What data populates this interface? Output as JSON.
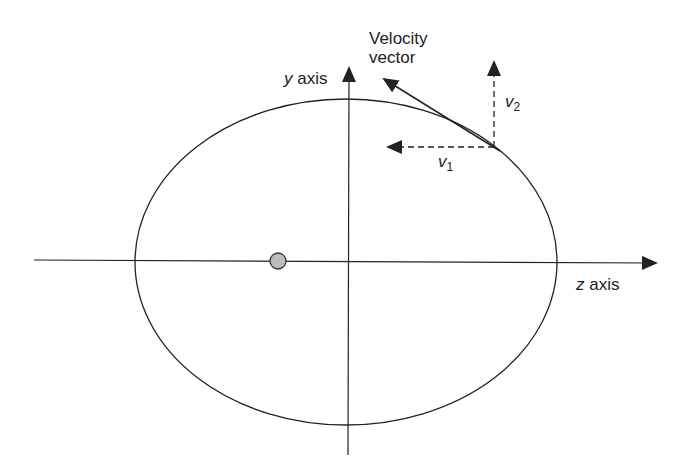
{
  "diagram": {
    "title_label_line1": "Velocity",
    "title_label_line2": "vector",
    "y_axis": {
      "var": "y",
      "text": " axis"
    },
    "z_axis": {
      "var": "z",
      "text": " axis"
    },
    "v1": {
      "var": "v",
      "sub": "1"
    },
    "v2": {
      "var": "v",
      "sub": "2"
    },
    "colors": {
      "stroke": "#222222",
      "focus_fill": "#bdbdbd",
      "background": "#ffffff"
    },
    "ellipse": {
      "cx": 346,
      "cy": 262,
      "rx": 211,
      "ry": 163
    },
    "focus": {
      "cx": 278,
      "cy": 261,
      "r": 8
    }
  }
}
